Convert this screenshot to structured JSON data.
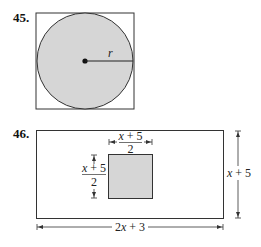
{
  "problems": [
    {
      "number": "45.",
      "figure": {
        "type": "circle inscribed in square",
        "radius_label": "r"
      }
    },
    {
      "number": "46.",
      "figure": {
        "type": "square inside rectangle",
        "inner_width_label_num": "x + 5",
        "inner_width_label_den": "2",
        "inner_height_label_num": "x + 5",
        "inner_height_label_den": "2",
        "outer_height_label": "x + 5",
        "outer_width_label": "2x + 3"
      }
    }
  ],
  "colors": {
    "shade": "#d6d6d6",
    "line": "#222222"
  }
}
